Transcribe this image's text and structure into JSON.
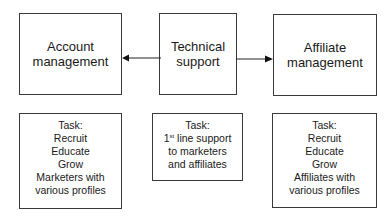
{
  "diagram": {
    "nodes": {
      "account": {
        "lines": [
          "Account",
          "management"
        ]
      },
      "technical": {
        "lines": [
          "Technical",
          "support"
        ]
      },
      "affiliate": {
        "lines": [
          "Affiliate",
          "management"
        ]
      }
    },
    "tasks": {
      "account": {
        "lines": [
          "Task:",
          "Recruit",
          "Educate",
          "Grow",
          "Marketers with",
          "various profiles"
        ]
      },
      "technical": {
        "title": "Task:",
        "line1_num": "1",
        "line1_sup": "st",
        "line1_rest": " line support",
        "lines": [
          "to marketers",
          "and affiliates"
        ]
      },
      "affiliate": {
        "lines": [
          "Task:",
          "Recruit",
          "Educate",
          "Grow",
          "Affiliates with",
          "various profiles"
        ]
      }
    },
    "edges": [
      {
        "from": "technical",
        "to": "account"
      },
      {
        "from": "technical",
        "to": "affiliate"
      }
    ]
  }
}
